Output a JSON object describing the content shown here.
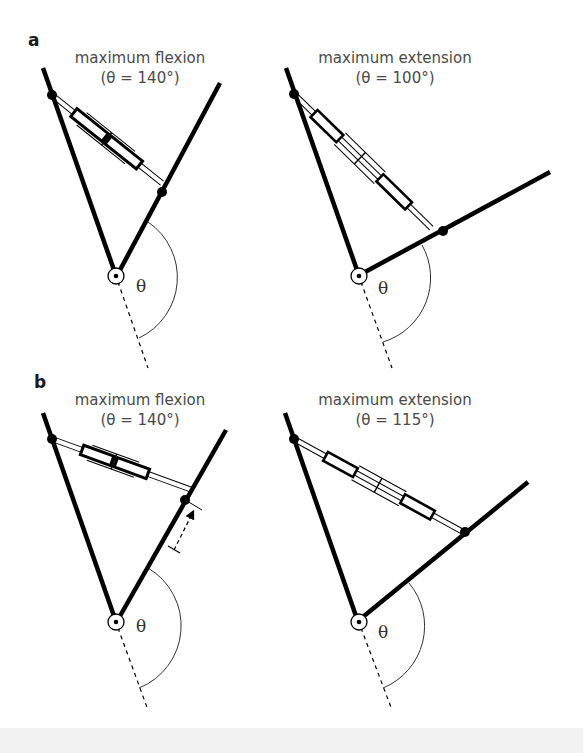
{
  "figure": {
    "panels": [
      {
        "letter": "a",
        "left": {
          "title": "maximum flexion",
          "subtitle": "(θ = 140°)",
          "angle_deg": 140,
          "angle_symbol": "θ"
        },
        "right": {
          "title": "maximum extension",
          "subtitle": "(θ = 100°)",
          "angle_deg": 100,
          "angle_symbol": "θ"
        }
      },
      {
        "letter": "b",
        "left": {
          "title": "maximum flexion",
          "subtitle": "(θ = 140°)",
          "angle_deg": 140,
          "angle_symbol": "θ"
        },
        "right": {
          "title": "maximum extension",
          "subtitle": "(θ = 115°)",
          "angle_deg": 115,
          "angle_symbol": "θ"
        }
      }
    ]
  },
  "colors": {
    "line": "#000000",
    "text": "#4a4a4a",
    "background": "#ffffff"
  }
}
